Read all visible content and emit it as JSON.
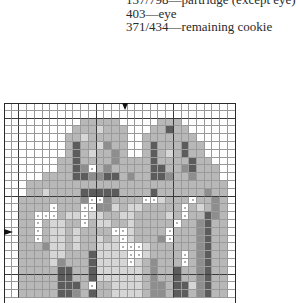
{
  "key": {
    "lines": [
      "137/798—partridge (except eye)",
      "403—eye",
      "371/434—remaining cookie"
    ]
  },
  "chart_data": {
    "type": "table",
    "columns": 30,
    "rows_visible": 25,
    "center_markers": {
      "top_arrow_column": 15,
      "left_arrow_row": 16
    },
    "bold_gridline_every": 10,
    "palette": {
      ".": "#ffffff",
      "a": "#d6d6d6",
      "b": "#b8b8b8",
      "c": "#8e8e8e",
      "d": "#5c5c5c",
      "o": "#ffffff"
    },
    "legend": {
      ".": "empty",
      "a": "light shade",
      "b": "medium shade",
      "c": "medium-dark shade",
      "d": "dark shade",
      "o": "bead / white stitch"
    },
    "grid": [
      "..............................",
      "..............................",
      "..........bbbbb.....bbb.......",
      ".........bbbabbb...bbdbb......",
      "........bbabbbbb..bbbbbbb.....",
      "........bdbbacbb..bdbbbdbb....",
      "........bdbabbcb..bdbabdbb....",
      ".......bbdbbbbcbbbbdbbbbdbb...",
      ".......bbdcobcbbbbbddbbcdbbb..",
      ".....bbbbddccddbcbbddcbbcbbb..",
      "...bbbbbbbbbbbbbbbbbbbbbbbbbb.",
      "...bbabbbbdddddbbbbdbbbbbbcbb.",
      "..bbbbbbbbcoocbbbbooabbbobbcb.",
      "..bbbbobbbooccabaabbbbbobabcb.",
      "..bbooobaaoaabbaabbbbabobbdcb.",
      "..bbobaabbobaabbabbbbbobbcdbb.",
      "..bbobaababbbbooabbbbobbbcdbb.",
      "..bbobaababbabaoabbbcobbbcdbb.",
      "..bbbcaababbaaaoooabbbbbbcdbb.",
      "..bbbbaabbbdaaaaooabbbbobcdbb.",
      "..bbbbacbbbdaaaaoabcbbbobcdbb.",
      "..bbbbbddbbdaaaaaabcbbdbbcdbb.",
      "..bbbbbddbbdaaaaaabcbbdbbcdbb.",
      "..bbbbbdddbobbaaaabccbddacdbb.",
      "..bbbbbddcbdbbaaaabccbddbcdbb."
    ]
  }
}
